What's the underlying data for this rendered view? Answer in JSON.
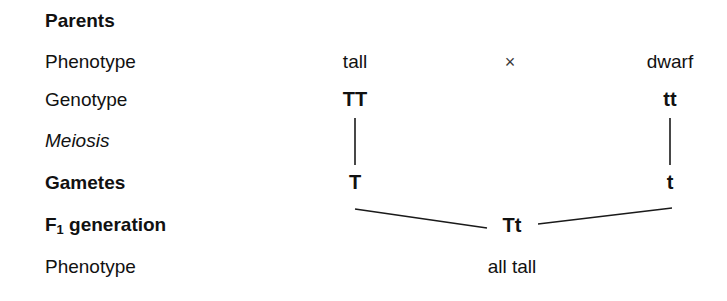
{
  "diagram": {
    "line_color": "#1a1a1a",
    "text_color": "#111111",
    "background": "#ffffff",
    "rows": [
      {
        "label": "Parents",
        "style": "bold"
      },
      {
        "label": "Phenotype",
        "style": "regular"
      },
      {
        "label": "Genotype",
        "style": "regular"
      },
      {
        "label": "Meiosis",
        "style": "italic"
      },
      {
        "label": "Gametes",
        "style": "bold"
      },
      {
        "label": "F1 generation",
        "style": "bold"
      },
      {
        "label": "Phenotype",
        "style": "regular"
      }
    ],
    "f1_label": {
      "prefix": "F",
      "subscript": "1",
      "suffix": " generation"
    },
    "values": {
      "parent_left_phenotype": "tall",
      "cross_symbol": "×",
      "parent_right_phenotype": "dwarf",
      "parent_left_genotype": "TT",
      "parent_right_genotype": "tt",
      "gamete_left": "T",
      "gamete_right": "t",
      "f1_genotype": "Tt",
      "f1_phenotype": "all tall"
    }
  }
}
